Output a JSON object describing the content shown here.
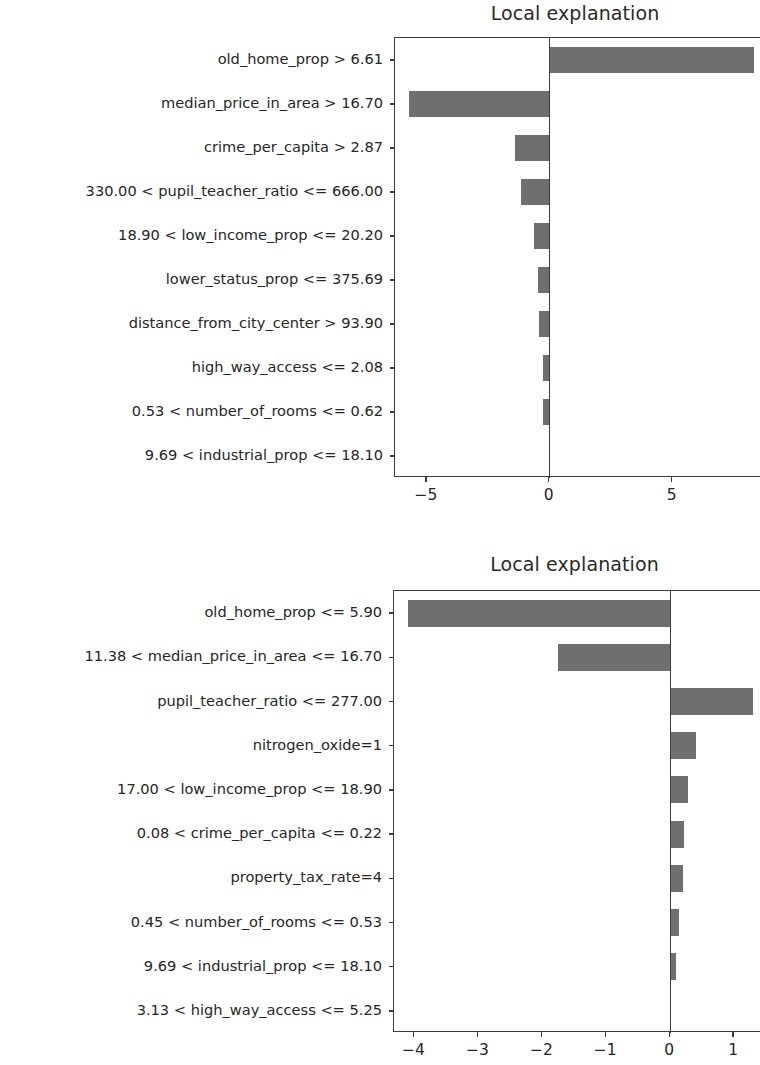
{
  "figures": [
    {
      "id": "figure-1",
      "title": "Local explanation",
      "chart_data": {
        "type": "bar",
        "orientation": "horizontal",
        "title": "Local explanation",
        "xlabel": "",
        "ylabel": "",
        "grid": false,
        "legend": null,
        "xlim": [
          -6.3,
          8.6
        ],
        "xticks": [
          -5,
          0,
          5
        ],
        "xticklabels": [
          "−5",
          "0",
          "5"
        ],
        "categories": [
          "old_home_prop > 6.61",
          "median_price_in_area > 16.70",
          "crime_per_capita > 2.87",
          "330.00 < pupil_teacher_ratio <= 666.00",
          "18.90 < low_income_prop <= 20.20",
          "lower_status_prop <= 375.69",
          "distance_from_city_center > 93.90",
          "high_way_access <= 2.08",
          "0.53 < number_of_rooms <= 0.62",
          "9.69 < industrial_prop <= 18.10"
        ],
        "values": [
          8.3,
          -5.72,
          -1.4,
          -1.18,
          -0.64,
          -0.47,
          -0.44,
          -0.26,
          -0.29,
          -0.03
        ]
      }
    },
    {
      "id": "figure-2",
      "title": "Local explanation",
      "chart_data": {
        "type": "bar",
        "orientation": "horizontal",
        "title": "Local explanation",
        "xlabel": "",
        "ylabel": "",
        "grid": false,
        "legend": null,
        "xlim": [
          -4.32,
          1.42
        ],
        "xticks": [
          -4,
          -3,
          -2,
          -1,
          0,
          1
        ],
        "xticklabels": [
          "−4",
          "−3",
          "−2",
          "−1",
          "0",
          "1"
        ],
        "categories": [
          "old_home_prop <= 5.90",
          "11.38 < median_price_in_area <= 16.70",
          "pupil_teacher_ratio <= 277.00",
          "nitrogen_oxide=1",
          "17.00 < low_income_prop <= 18.90",
          "0.08 < crime_per_capita <= 0.22",
          "property_tax_rate=4",
          "0.45 < number_of_rooms <= 0.53",
          "9.69 < industrial_prop <= 18.10",
          "3.13 < high_way_access <= 5.25"
        ],
        "values": [
          -4.1,
          -1.75,
          1.3,
          0.4,
          0.28,
          0.22,
          0.2,
          0.14,
          0.09,
          0.02
        ]
      }
    }
  ],
  "style": {
    "bar_color": "#6f6f6f",
    "axis_color": "#3d3d3d",
    "text_color": "#262626",
    "background": "#ffffff"
  }
}
